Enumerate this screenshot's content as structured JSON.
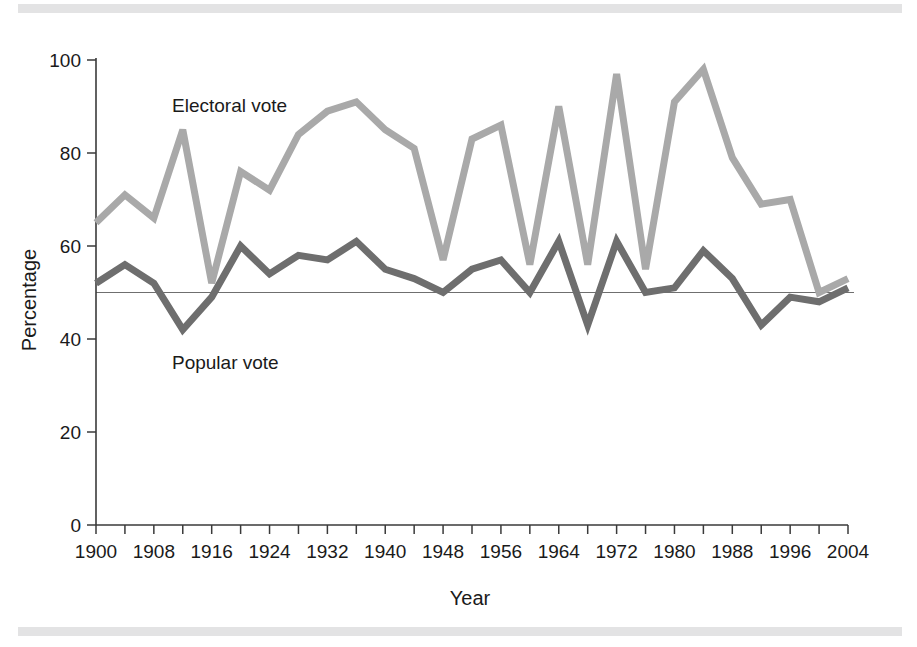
{
  "figure": {
    "background_color": "#ffffff",
    "rule_color": "#e3e3e4"
  },
  "axes": {
    "y_title": "Percentage",
    "x_title": "Year",
    "y_ticks": [
      "0",
      "20",
      "40",
      "60",
      "80",
      "100"
    ],
    "x_ticks": [
      "1900",
      "1908",
      "1916",
      "1924",
      "1932",
      "1940",
      "1948",
      "1956",
      "1964",
      "1972",
      "1980",
      "1988",
      "1996",
      "2004"
    ],
    "reference_line_value": 50
  },
  "annotations": {
    "electoral_label": "Electoral vote",
    "popular_label": "Popular vote"
  },
  "chart_data": {
    "type": "line",
    "title": "",
    "xlabel": "Year",
    "ylabel": "Percentage",
    "xlim": [
      1900,
      2004
    ],
    "ylim": [
      0,
      100
    ],
    "grid": false,
    "legend_position": "inline-annotation",
    "reference_line": 50,
    "x": [
      1900,
      1904,
      1908,
      1912,
      1916,
      1920,
      1924,
      1928,
      1932,
      1936,
      1940,
      1944,
      1948,
      1952,
      1956,
      1960,
      1964,
      1968,
      1972,
      1976,
      1980,
      1984,
      1988,
      1992,
      1996,
      2000,
      2004
    ],
    "series": [
      {
        "name": "Electoral vote",
        "color": "#a9a9a9",
        "values": [
          65,
          71,
          66,
          85,
          52,
          76,
          72,
          84,
          89,
          91,
          85,
          81,
          57,
          83,
          86,
          56,
          90,
          56,
          97,
          55,
          91,
          98,
          79,
          69,
          70,
          50,
          53
        ]
      },
      {
        "name": "Popular vote",
        "color": "#6e6e6e",
        "values": [
          52,
          56,
          52,
          42,
          49,
          60,
          54,
          58,
          57,
          61,
          55,
          53,
          50,
          55,
          57,
          50,
          61,
          43,
          61,
          50,
          51,
          59,
          53,
          43,
          49,
          48,
          51
        ]
      }
    ]
  }
}
